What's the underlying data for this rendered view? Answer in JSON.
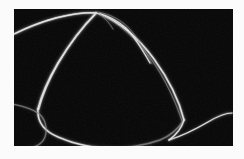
{
  "figure": {
    "kind": "dark-field-micrograph",
    "caption": "",
    "plate": {
      "x": 14,
      "y": 9,
      "width": 219,
      "height": 137,
      "background_color": "#050505",
      "border_color": "#fbfbfb"
    },
    "page_background_color": "#fbfbfb",
    "filament_color": "#f2f2f2",
    "filament_dim_color": "#8f8f8f",
    "filament_glow_color": "#5a5a5a"
  },
  "features": {
    "description": "Bright thread-like filaments on a black field forming one large closed loop with a sharp apex near the top, a smaller partial loop at lower left, and a free tail sweeping to the lower right.",
    "apex_point": {
      "x": 82,
      "y": 4
    },
    "left_crossing_point": {
      "x": 26,
      "y": 101
    },
    "valley_point": {
      "x": 154,
      "y": 131
    },
    "tail_end_point": {
      "x": 218,
      "y": 104
    }
  },
  "strokes": [
    {
      "name": "upper-left-arc",
      "label": "upper left arc entering from left edge to apex",
      "width": 1.5,
      "brightness": "bright",
      "path": "M -2,26 C 10,20 24,14 42,9 C 58,5 70,3 82,4"
    },
    {
      "name": "upper-left-arc-highlight",
      "label": "bright highlight along upper left arc",
      "width": 0.7,
      "brightness": "peak",
      "path": "M 2,24 C 14,18 28,12 45,8 C 60,5 71,3 81,4"
    },
    {
      "name": "loop-left-descending-limb",
      "label": "left limb of the large loop running from apex down to the left crossing",
      "width": 1.7,
      "brightness": "bright",
      "path": "M 82,4 C 70,16 56,34 44,54 C 34,71 27,88 24,100"
    },
    {
      "name": "loop-left-limb-highlight",
      "label": "specular highlight on left limb of loop",
      "width": 0.8,
      "brightness": "peak",
      "path": "M 81,6 C 69,18 55,36 44,55 C 35,71 28,88 25,100"
    },
    {
      "name": "loop-left-bottom-bend",
      "label": "lower-left bend of the large loop sweeping under to the bottom",
      "width": 1.5,
      "brightness": "bright",
      "path": "M 24,100 C 23,112 30,122 44,128 C 60,135 78,139 96,139"
    },
    {
      "name": "loop-bottom-run",
      "label": "bottom run of the large loop sweeping right along the lower edge",
      "width": 1.4,
      "brightness": "medium",
      "path": "M 96,139 C 114,139 132,136 146,131 C 156,127 164,120 170,111"
    },
    {
      "name": "loop-right-limb",
      "label": "right limb of the large loop ascending from the bottom back to the apex",
      "width": 1.6,
      "brightness": "bright",
      "path": "M 170,111 C 166,95 156,72 140,50 C 126,31 110,15 86,5"
    },
    {
      "name": "loop-right-limb-inner",
      "label": "inner twin strand paralleling the right limb",
      "width": 1.0,
      "brightness": "medium",
      "path": "M 168,112 C 162,94 152,71 137,50 C 123,31 106,14 85,5"
    },
    {
      "name": "apex-fork-strand",
      "label": "short forked strand branching from the apex to the right",
      "width": 1.1,
      "brightness": "bright",
      "path": "M 82,4 C 92,6 102,10 112,19 C 120,27 128,40 136,54"
    },
    {
      "name": "apex-fork-strand-outer",
      "label": "outer edge of the apex fork",
      "width": 0.7,
      "brightness": "medium",
      "path": "M 84,3 C 95,5 105,9 115,19 C 123,28 131,41 138,55"
    },
    {
      "name": "apex-notch",
      "label": "tiny notch between the two strands leaving the apex",
      "width": 0.8,
      "brightness": "medium",
      "path": "M 86,5 C 92,10 96,15 99,20"
    },
    {
      "name": "lower-left-partial-loop",
      "label": "small partial loop at the lower left crossing under the main loop",
      "width": 1.2,
      "brightness": "medium",
      "path": "M -2,95 C 8,97 18,100 24,104 C 30,108 33,116 32,124 C 31,132 25,137 16,139"
    },
    {
      "name": "lower-left-exit-strand",
      "label": "strand exiting the lower-left partial loop toward the bottom left edge",
      "width": 1.0,
      "brightness": "dim",
      "path": "M 16,139 C 10,140 4,140 -2,139"
    },
    {
      "name": "valley-descent",
      "label": "filament descending from the right limb into the sharp V valley",
      "width": 1.3,
      "brightness": "bright",
      "path": "M 170,111 C 168,118 162,126 155,131"
    },
    {
      "name": "tail-sweep",
      "label": "free tail rising from the V valley to the lower right",
      "width": 1.2,
      "brightness": "bright",
      "path": "M 155,131 C 168,127 182,120 194,113 C 204,107 212,104 218,104"
    },
    {
      "name": "bottom-faint-link",
      "label": "faint broken filament continuing along the very bottom",
      "width": 0.8,
      "brightness": "dim",
      "path": "M 96,139 C 110,140 124,140 138,137"
    }
  ]
}
